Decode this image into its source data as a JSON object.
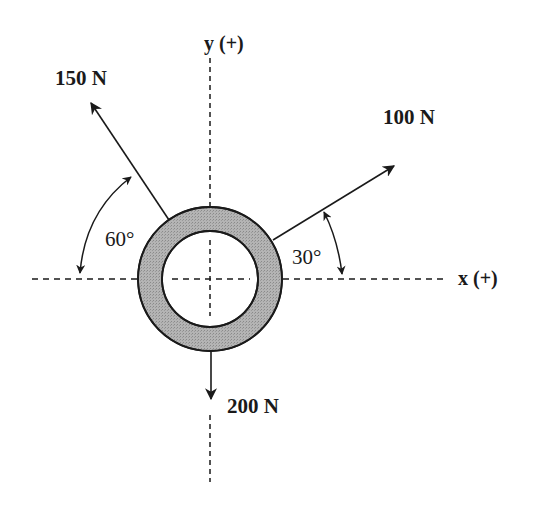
{
  "diagram": {
    "type": "force-diagram",
    "axes": {
      "x_label": "x (+)",
      "y_label": "y (+)"
    },
    "forces": [
      {
        "id": "f1",
        "label": "150 N",
        "magnitude": 150,
        "unit": "N",
        "angle_label": "60°",
        "angle_ref": "negative x-axis",
        "direction": "up-left"
      },
      {
        "id": "f2",
        "label": "100 N",
        "magnitude": 100,
        "unit": "N",
        "angle_label": "30°",
        "angle_ref": "positive x-axis",
        "direction": "up-right"
      },
      {
        "id": "f3",
        "label": "200 N",
        "magnitude": 200,
        "unit": "N",
        "direction": "down"
      }
    ],
    "ring": {
      "fill_color": "#a8a8a8",
      "stroke_color": "#1a1a1a"
    },
    "colors": {
      "line": "#1a1a1a",
      "background": "#ffffff"
    }
  }
}
